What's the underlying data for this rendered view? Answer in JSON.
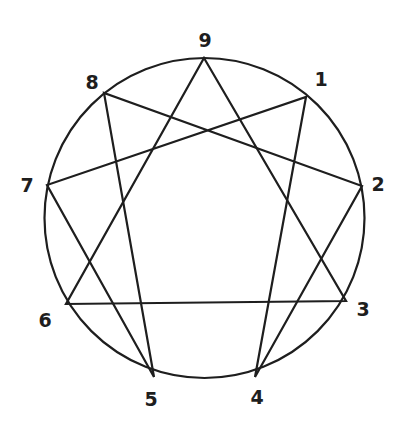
{
  "colors": {
    "stroke": "#1e1e1e",
    "background": "#ffffff"
  },
  "circle": {
    "cx": 204.5,
    "cy": 218,
    "r": 160
  },
  "points": [
    {
      "id": "1",
      "label": "1",
      "x": 306,
      "y": 97,
      "lx": 321,
      "ly": 86
    },
    {
      "id": "2",
      "label": "2",
      "x": 362,
      "y": 186,
      "lx": 378,
      "ly": 191
    },
    {
      "id": "3",
      "label": "3",
      "x": 346,
      "y": 301,
      "lx": 363,
      "ly": 316
    },
    {
      "id": "4",
      "label": "4",
      "x": 255,
      "y": 377,
      "lx": 257,
      "ly": 404
    },
    {
      "id": "5",
      "label": "5",
      "x": 154,
      "y": 377,
      "lx": 151,
      "ly": 406
    },
    {
      "id": "6",
      "label": "6",
      "x": 66,
      "y": 304,
      "lx": 45,
      "ly": 327
    },
    {
      "id": "7",
      "label": "7",
      "x": 47,
      "y": 185,
      "lx": 27,
      "ly": 192
    },
    {
      "id": "8",
      "label": "8",
      "x": 104,
      "y": 93,
      "lx": 92,
      "ly": 89
    },
    {
      "id": "9",
      "label": "9",
      "x": 204,
      "y": 58,
      "lx": 205,
      "ly": 47
    }
  ],
  "triangle": [
    "9",
    "3",
    "6"
  ],
  "hexad": [
    "1",
    "4",
    "2",
    "8",
    "5",
    "7"
  ]
}
